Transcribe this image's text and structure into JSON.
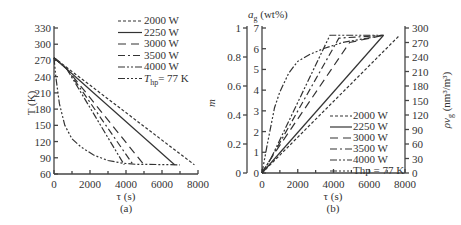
{
  "chart_data": [
    {
      "type": "line",
      "panel_label": "(a)",
      "xlabel": "τ (s)",
      "ylabel": "T (K)",
      "xlim": [
        0,
        8000
      ],
      "ylim": [
        60,
        330
      ],
      "xticks": [
        0,
        2000,
        4000,
        6000,
        8000
      ],
      "yticks": [
        60,
        90,
        120,
        150,
        180,
        210,
        240,
        270,
        300,
        330
      ],
      "grid": false,
      "legend_position": "upper right",
      "series": [
        {
          "name": "2000 W",
          "dash": "3,2",
          "x": [
            0,
            7800
          ],
          "y": [
            275,
            77
          ]
        },
        {
          "name": "2250 W",
          "dash": "",
          "x": [
            0,
            6700
          ],
          "y": [
            275,
            77
          ]
        },
        {
          "name": "3000 W",
          "dash": "8,5",
          "x": [
            0,
            700,
            5000
          ],
          "y": [
            275,
            255,
            77
          ]
        },
        {
          "name": "3500 W",
          "dash": "7,3,2,3",
          "x": [
            0,
            700,
            4400
          ],
          "y": [
            275,
            255,
            77
          ]
        },
        {
          "name": "4000 W",
          "dash": "7,2,2,2,2,2",
          "x": [
            0,
            700,
            3900
          ],
          "y": [
            275,
            255,
            77
          ]
        },
        {
          "name": "Thp = 77 K",
          "dash": "7,2,2,2,2,2,2,2",
          "x": [
            0,
            100,
            300,
            600,
            1000,
            1500,
            2200,
            3000,
            3800,
            4500,
            7000
          ],
          "y": [
            275,
            240,
            190,
            150,
            125,
            110,
            95,
            85,
            80,
            78,
            77
          ]
        }
      ]
    },
    {
      "type": "line",
      "panel_label": "(b)",
      "xlabel": "τ (s)",
      "ylabel_left": "m",
      "ylabel_inner": "a_g (wt%)",
      "ylabel_right": "ρv_g (nm³/m³)",
      "xlim": [
        0,
        8000
      ],
      "ylim_left": [
        0,
        1
      ],
      "ylim_inner": [
        0,
        7
      ],
      "ylim_right": [
        0,
        300
      ],
      "xticks": [
        0,
        2000,
        4000,
        6000,
        8000
      ],
      "yticks_left": [
        0,
        0.2,
        0.4,
        0.6,
        0.8,
        1
      ],
      "yticks_inner": [
        0,
        1,
        2,
        3,
        4,
        5,
        6,
        7
      ],
      "yticks_right": [
        0,
        30,
        60,
        90,
        120,
        150,
        180,
        210,
        240,
        270,
        300
      ],
      "grid": false,
      "legend_position": "lower right",
      "series": [
        {
          "name": "2000 W",
          "dash": "3,2",
          "x": [
            0,
            7700
          ],
          "y": [
            0,
            0.95
          ]
        },
        {
          "name": "2250 W",
          "dash": "",
          "x": [
            0,
            6800
          ],
          "y": [
            0,
            0.95
          ]
        },
        {
          "name": "3000 W",
          "dash": "8,5",
          "x": [
            0,
            500,
            4900,
            6800
          ],
          "y": [
            0,
            0.1,
            0.9,
            0.95
          ]
        },
        {
          "name": "3500 W",
          "dash": "7,3,2,3",
          "x": [
            0,
            500,
            4300,
            6800
          ],
          "y": [
            0,
            0.1,
            0.93,
            0.95
          ]
        },
        {
          "name": "4000 W",
          "dash": "7,2,2,2,2,2",
          "x": [
            0,
            500,
            3800,
            6800
          ],
          "y": [
            0,
            0.1,
            0.95,
            0.95
          ]
        },
        {
          "name": "Thp = 77 K",
          "dash": "7,2,2,2,2,2,2,2",
          "x": [
            0,
            300,
            700,
            1000,
            1500,
            2000,
            2700,
            3500,
            4500,
            6800
          ],
          "y": [
            0,
            0.2,
            0.45,
            0.56,
            0.69,
            0.77,
            0.82,
            0.86,
            0.9,
            0.95
          ]
        }
      ]
    }
  ],
  "text": {
    "a_ylabel": "T (K)",
    "a_xlabel": "τ (s)",
    "a_panel": "(a)",
    "b_xlabel": "τ (s)",
    "b_panel": "(b)",
    "b_ylabel_m": "m",
    "b_ylabel_ag": "a",
    "b_ylabel_ag_sub": "g",
    "b_ylabel_ag_unit": " (wt%)",
    "b_ylabel_rho": "ρv",
    "b_ylabel_rho_sub": "g",
    "b_ylabel_rho_unit": " (nm³/m³)",
    "legend_a": [
      "2000 W",
      "2250 W",
      "3000 W",
      "3500 W",
      "4000 W"
    ],
    "legend_a_last": "T",
    "legend_a_last_sub": "hp",
    "legend_a_last_rest": "= 77 K",
    "legend_b": [
      "2000 W",
      "2250 W",
      "3000 W",
      "3500 W",
      "4000 W",
      "Thp = 77 K"
    ]
  }
}
